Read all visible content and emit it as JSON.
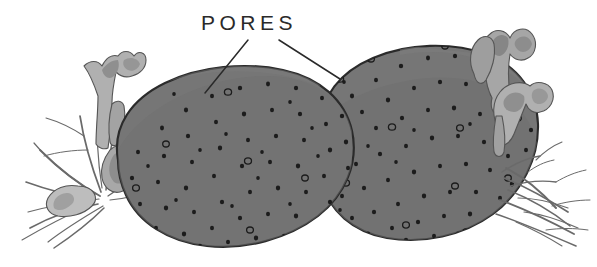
{
  "figure": {
    "kind": "hand-drawn-ink-and-wash-illustration",
    "background_color": "#ffffff"
  },
  "annotation": {
    "label": "PORES",
    "label_x": 201,
    "label_y": 30,
    "leader_lines": [
      {
        "name": "leader-line-left",
        "x1": 248,
        "y1": 40,
        "x2": 205,
        "y2": 93
      },
      {
        "name": "leader-line-right",
        "x1": 279,
        "y1": 40,
        "x2": 340,
        "y2": 79
      }
    ]
  },
  "palette": {
    "body_fill": "#767676",
    "body_fill_shade": "#6e6e6e",
    "body_outline": "#2b2b2b",
    "pore_dot": "#1c1c1c",
    "weed_light": "#b4b4b4",
    "weed_mid": "#9a9a9a",
    "weed_dark": "#828282",
    "weed_outline": "#555555",
    "branch_stroke": "#6a6a6a",
    "label_ink": "#2a2a2a"
  },
  "elements": {
    "left_sponge": {
      "name": "left-sponge-body",
      "center_x": 255,
      "center_y": 155
    },
    "right_sponge": {
      "name": "right-sponge-body",
      "center_x": 420,
      "center_y": 145
    },
    "left_seaweed": {
      "name": "left-seaweed-cluster"
    },
    "right_seaweed": {
      "name": "right-seaweed-cluster"
    },
    "left_branches": {
      "name": "left-branch-cluster"
    },
    "right_branches": {
      "name": "right-branch-cluster"
    }
  },
  "pores": {
    "plain_count": 176,
    "ringed_count": 14,
    "description": "small dark ink dots scattered evenly across both sponge surfaces, a few drawn as tiny open rings"
  }
}
